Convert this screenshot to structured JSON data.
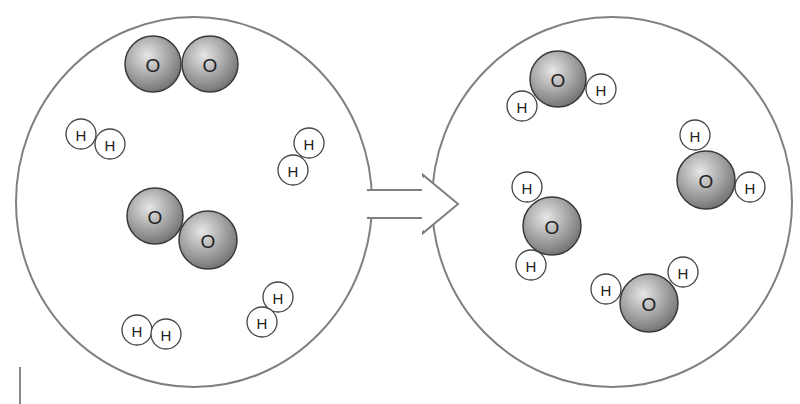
{
  "diagram": {
    "colors": {
      "outline": "#808080",
      "oxygen_fill_light": "#d8d8d8",
      "oxygen_fill_dark": "#7a7a7a",
      "oxygen_stroke": "#3a3a3a",
      "hydrogen_fill": "#ffffff",
      "hydrogen_stroke": "#444444",
      "text": "#222222"
    },
    "arrow": {
      "direction": "right",
      "label": ""
    },
    "reactants": {
      "container": {
        "cx": 194,
        "cy": 202,
        "rx": 178,
        "ry": 185
      },
      "molecules": [
        {
          "formula": "O2",
          "atoms": [
            {
              "el": "O",
              "label": "O",
              "x": 153,
              "y": 64,
              "r": 28
            },
            {
              "el": "O",
              "label": "O",
              "x": 210,
              "y": 64,
              "r": 28
            }
          ]
        },
        {
          "formula": "H2",
          "atoms": [
            {
              "el": "H",
              "label": "H",
              "x": 81,
              "y": 134,
              "r": 15
            },
            {
              "el": "H",
              "label": "H",
              "x": 110,
              "y": 144,
              "r": 15
            }
          ]
        },
        {
          "formula": "H2",
          "atoms": [
            {
              "el": "H",
              "label": "H",
              "x": 309,
              "y": 143,
              "r": 15
            },
            {
              "el": "H",
              "label": "H",
              "x": 293,
              "y": 170,
              "r": 15
            }
          ]
        },
        {
          "formula": "O2",
          "atoms": [
            {
              "el": "O",
              "label": "O",
              "x": 155,
              "y": 216,
              "r": 28
            },
            {
              "el": "O",
              "label": "O",
              "x": 208,
              "y": 240,
              "r": 29
            }
          ]
        },
        {
          "formula": "H2",
          "atoms": [
            {
              "el": "H",
              "label": "H",
              "x": 278,
              "y": 297,
              "r": 15
            },
            {
              "el": "H",
              "label": "H",
              "x": 262,
              "y": 322,
              "r": 15
            }
          ]
        },
        {
          "formula": "H2",
          "atoms": [
            {
              "el": "H",
              "label": "H",
              "x": 137,
              "y": 330,
              "r": 15
            },
            {
              "el": "H",
              "label": "H",
              "x": 166,
              "y": 334,
              "r": 15
            }
          ]
        }
      ]
    },
    "products": {
      "container": {
        "cx": 612,
        "cy": 202,
        "rx": 180,
        "ry": 185
      },
      "molecules": [
        {
          "formula": "H2O",
          "atoms": [
            {
              "el": "O",
              "label": "O",
              "x": 558,
              "y": 79,
              "r": 28
            },
            {
              "el": "H",
              "label": "H",
              "x": 522,
              "y": 106,
              "r": 15
            },
            {
              "el": "H",
              "label": "H",
              "x": 601,
              "y": 89,
              "r": 15
            }
          ]
        },
        {
          "formula": "H2O",
          "atoms": [
            {
              "el": "O",
              "label": "O",
              "x": 706,
              "y": 180,
              "r": 29
            },
            {
              "el": "H",
              "label": "H",
              "x": 695,
              "y": 135,
              "r": 15
            },
            {
              "el": "H",
              "label": "H",
              "x": 750,
              "y": 187,
              "r": 15
            }
          ]
        },
        {
          "formula": "H2O",
          "atoms": [
            {
              "el": "O",
              "label": "O",
              "x": 552,
              "y": 226,
              "r": 29
            },
            {
              "el": "H",
              "label": "H",
              "x": 527,
              "y": 187,
              "r": 15
            },
            {
              "el": "H",
              "label": "H",
              "x": 531,
              "y": 265,
              "r": 15
            }
          ]
        },
        {
          "formula": "H2O",
          "atoms": [
            {
              "el": "O",
              "label": "O",
              "x": 649,
              "y": 303,
              "r": 29
            },
            {
              "el": "H",
              "label": "H",
              "x": 606,
              "y": 289,
              "r": 15
            },
            {
              "el": "H",
              "label": "H",
              "x": 683,
              "y": 272,
              "r": 15
            }
          ]
        }
      ]
    },
    "margin_mark": {
      "x": 20,
      "y1": 367,
      "y2": 404
    }
  }
}
